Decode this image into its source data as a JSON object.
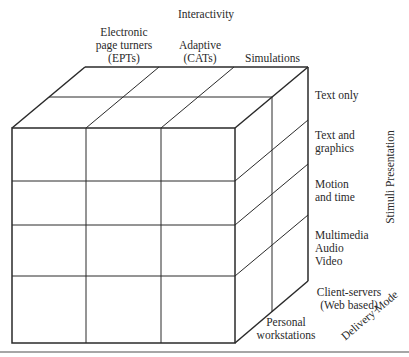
{
  "axes": {
    "interactivity": {
      "title": "Interactivity",
      "levels": [
        {
          "line1": "Electronic",
          "line2": "page turners",
          "line3": "(EPTs)"
        },
        {
          "line1": "Adaptive",
          "line2": "(CATs)"
        },
        {
          "line1": "Simulations"
        }
      ]
    },
    "stimuli_presentation": {
      "title": "Stimuli Presentation",
      "levels": [
        {
          "line1": "Text only"
        },
        {
          "line1": "Text and",
          "line2": "graphics"
        },
        {
          "line1": "Motion",
          "line2": "and time"
        },
        {
          "line1": "Multimedia",
          "line2": "Audio",
          "line3": "Video"
        }
      ]
    },
    "delivery_mode": {
      "title": "Delivery Mode",
      "levels": [
        {
          "line1": "Client-servers",
          "line2": "(Web based)"
        },
        {
          "line1": "Personal",
          "line2": "workstations"
        }
      ]
    }
  },
  "colors": {
    "line": "#2a2a2a",
    "rule": "#888888",
    "background": "#ffffff"
  }
}
